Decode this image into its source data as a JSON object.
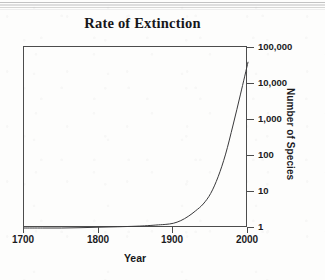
{
  "figure": {
    "title": "Rate of Extinction"
  },
  "axes": {
    "x_title": "Year",
    "y_title": "Number of Species",
    "x_ticks": [
      "1700",
      "1800",
      "1900",
      "2000"
    ],
    "y_ticks": [
      "100,000",
      "10,000",
      "1,000",
      "100",
      "10",
      "1"
    ]
  },
  "chart_data": {
    "type": "line",
    "title": "Rate of Extinction",
    "xlabel": "Year",
    "ylabel": "Number of Species",
    "xlim": [
      1700,
      2000
    ],
    "ylim": [
      1,
      100000
    ],
    "yscale": "log",
    "xscale": "linear",
    "grid": false,
    "legend": null,
    "xticks": [
      1700,
      1800,
      1900,
      2000
    ],
    "xticklabels": [
      "1700",
      "1800",
      "1900",
      "2000"
    ],
    "yticks": [
      1,
      10,
      100,
      1000,
      10000,
      100000
    ],
    "yticklabels": [
      "1",
      "10",
      "100",
      "1,000",
      "10,000",
      "100,000"
    ],
    "y_axis_position": "right",
    "series": [
      {
        "name": "Extinction rate",
        "x": [
          1700,
          1725,
          1750,
          1775,
          1800,
          1825,
          1850,
          1865,
          1880,
          1890,
          1900,
          1910,
          1920,
          1930,
          1940,
          1950,
          1960,
          1970,
          1980,
          1990,
          2000
        ],
        "y": [
          1.0,
          1.0,
          1.0,
          1.02,
          1.05,
          1.08,
          1.12,
          1.16,
          1.22,
          1.26,
          1.35,
          1.6,
          2.1,
          3.0,
          4.6,
          9,
          26,
          110,
          700,
          5000,
          38000
        ]
      }
    ],
    "annotations": []
  }
}
